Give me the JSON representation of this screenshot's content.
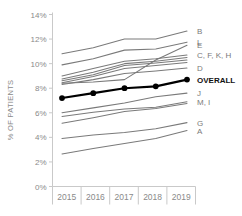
{
  "chart_data": {
    "type": "line",
    "title": "",
    "xlabel": "",
    "ylabel": "% OF PATIENTS",
    "x": [
      "2015",
      "2016",
      "2017",
      "2018",
      "2019"
    ],
    "categories": [
      "2015",
      "2016",
      "2017",
      "2018",
      "2019"
    ],
    "ylim": [
      0,
      14
    ],
    "ytick_labels": [
      "0%",
      "2%",
      "4%",
      "6%",
      "8%",
      "10%",
      "12%",
      "14%"
    ],
    "ytick_values": [
      0,
      2,
      4,
      6,
      8,
      10,
      12,
      14
    ],
    "grid": false,
    "legend_position": "right-of-plot-inline",
    "series": [
      {
        "name": "B",
        "label": "B",
        "values": [
          10.8,
          11.3,
          12.0,
          12.0,
          12.65
        ],
        "highlight": false
      },
      {
        "name": "L",
        "label": "L",
        "values": [
          9.9,
          10.4,
          11.1,
          11.2,
          11.75
        ],
        "highlight": false
      },
      {
        "name": "E",
        "label": "E",
        "values": [
          8.4,
          8.5,
          8.7,
          10.3,
          11.5
        ],
        "highlight": false
      },
      {
        "name": "C, F, K, H",
        "label": "C, F, K, H",
        "values": [
          9.0,
          9.6,
          10.2,
          10.4,
          10.7
        ],
        "highlight": false
      },
      {
        "name": "C2",
        "label": "",
        "values": [
          8.75,
          9.3,
          10.0,
          10.2,
          10.5
        ],
        "highlight": false
      },
      {
        "name": "F2",
        "label": "",
        "values": [
          8.6,
          9.1,
          9.85,
          10.05,
          10.3
        ],
        "highlight": false
      },
      {
        "name": "K2",
        "label": "",
        "values": [
          8.45,
          8.95,
          9.6,
          9.85,
          10.1
        ],
        "highlight": false
      },
      {
        "name": "D",
        "label": "D",
        "values": [
          8.3,
          8.7,
          9.2,
          9.4,
          9.65
        ],
        "highlight": false
      },
      {
        "name": "OVERALL",
        "label": "OVERALL",
        "values": [
          7.2,
          7.6,
          8.0,
          8.15,
          8.7
        ],
        "highlight": true
      },
      {
        "name": "J",
        "label": "J",
        "values": [
          6.0,
          6.4,
          6.8,
          7.3,
          7.6
        ],
        "highlight": false
      },
      {
        "name": "M, I",
        "label": "M, I",
        "values": [
          5.7,
          6.05,
          6.3,
          6.45,
          6.9
        ],
        "highlight": false
      },
      {
        "name": "I2",
        "label": "",
        "values": [
          5.15,
          5.6,
          6.1,
          6.35,
          6.75
        ],
        "highlight": false
      },
      {
        "name": "G",
        "label": "G",
        "values": [
          3.9,
          4.2,
          4.4,
          4.7,
          5.2
        ],
        "highlight": false
      },
      {
        "name": "A",
        "label": "A",
        "values": [
          2.65,
          3.1,
          3.5,
          3.9,
          4.55
        ],
        "highlight": false
      }
    ]
  },
  "axis": {
    "y_title": "% OF PATIENTS",
    "y_ticks": [
      "14%",
      "12%",
      "10%",
      "8%",
      "6%",
      "4%",
      "2%",
      "0%"
    ],
    "x_ticks": [
      "2015",
      "2016",
      "2017",
      "2018",
      "2019"
    ]
  },
  "colors": {
    "line": "#7a7a7a",
    "highlight": "#000000",
    "axis": "#c9c9c9",
    "text": "#8a8a8a",
    "highlight_text": "#111111",
    "background": "#ffffff"
  },
  "labels": {
    "b": "B",
    "l": "L",
    "e": "E",
    "cfkh": "C, F, K, H",
    "d": "D",
    "overall": "OVERALL",
    "j": "J",
    "mi": "M, I",
    "g": "G",
    "a": "A"
  }
}
